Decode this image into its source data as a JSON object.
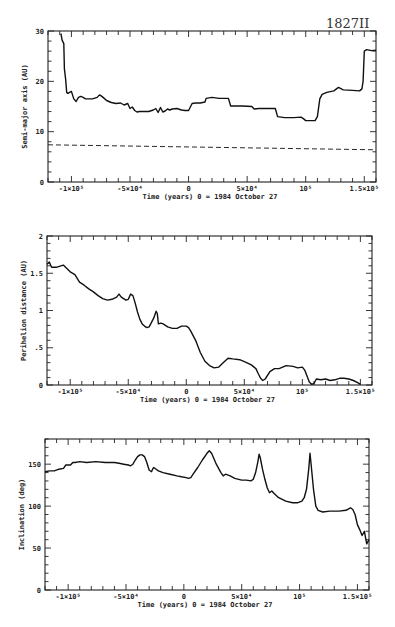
{
  "figure_label": "1827II",
  "chart_data": [
    {
      "type": "line",
      "title": "",
      "xlabel": "Time (years)  0 = 1984 October 27",
      "ylabel": "Semi-major axis (AU)",
      "xlim": [
        -120000,
        160000
      ],
      "ylim": [
        0,
        30
      ],
      "grid": false,
      "yticks": [
        0,
        10,
        20,
        30
      ],
      "ytick_labels": [
        "0",
        "10",
        "20",
        "30"
      ],
      "xticks": [
        -100000,
        -50000,
        0,
        50000,
        100000,
        150000
      ],
      "xtick_labels": [
        "-1×10⁵",
        "-5×10⁴",
        "0",
        "5×10⁴",
        "10⁵",
        "1.5×10⁵"
      ],
      "series": [
        {
          "name": "semi-major axis",
          "style": "solid",
          "x": [
            -109000,
            -108000,
            -106500,
            -106000,
            -105000,
            -104000,
            -103000,
            -100000,
            -98000,
            -96000,
            -94000,
            -92000,
            -90000,
            -88000,
            -86000,
            -82000,
            -78000,
            -76000,
            -74000,
            -72000,
            -70000,
            -68000,
            -66000,
            -62000,
            -58000,
            -55000,
            -52000,
            -50000,
            -48000,
            -46000,
            -44000,
            -42000,
            -38000,
            -34000,
            -30000,
            -28000,
            -26000,
            -24000,
            -22000,
            -20000,
            -18000,
            -16000,
            -14000,
            -10000,
            -6000,
            -3000,
            0,
            3000,
            6000,
            10000,
            14000,
            15000,
            20000,
            26000,
            34000,
            36000,
            40000,
            46000,
            54000,
            56000,
            60000,
            66000,
            74000,
            76000,
            82000,
            90000,
            96000,
            98000,
            100000,
            104000,
            108000,
            110000,
            112000,
            114000,
            118000,
            124000,
            128000,
            132000,
            140000,
            146000,
            148000,
            149000,
            150000,
            152000,
            156000,
            160000
          ],
          "y": [
            29.5,
            28.2,
            27.5,
            22.5,
            20.5,
            17.8,
            17.6,
            18.0,
            16.5,
            16.0,
            16.8,
            17.0,
            16.8,
            16.5,
            16.5,
            16.5,
            16.8,
            17.3,
            17.0,
            16.6,
            16.2,
            16.0,
            15.8,
            15.6,
            15.7,
            15.3,
            15.6,
            14.6,
            14.9,
            14.2,
            13.9,
            14.0,
            14.0,
            14.0,
            14.3,
            14.6,
            13.8,
            14.8,
            13.9,
            14.1,
            14.5,
            14.3,
            14.5,
            14.6,
            14.3,
            14.2,
            14.2,
            15.6,
            15.7,
            15.7,
            15.9,
            16.6,
            16.8,
            16.6,
            16.6,
            15.1,
            15.1,
            15.1,
            15.0,
            14.5,
            14.6,
            14.6,
            14.6,
            13.0,
            12.8,
            12.8,
            12.9,
            12.6,
            12.2,
            12.2,
            12.2,
            13.0,
            16.5,
            17.4,
            17.8,
            18.1,
            18.8,
            18.3,
            18.2,
            18.1,
            18.5,
            20.0,
            26.0,
            26.3,
            26.1,
            26.2
          ]
        },
        {
          "name": "reference (dashed)",
          "style": "dashed",
          "x": [
            -120000,
            160000
          ],
          "y": [
            7.4,
            6.4
          ]
        }
      ]
    },
    {
      "type": "line",
      "title": "",
      "xlabel": "Time (years)  0 = 1984 October 27",
      "ylabel": "Perihelion distance (AU)",
      "xlim": [
        -120000,
        160000
      ],
      "ylim": [
        0,
        2
      ],
      "grid": false,
      "yticks": [
        0,
        0.5,
        1,
        1.5,
        2
      ],
      "ytick_labels": [
        "0",
        ".5",
        "1",
        "1.5",
        "2"
      ],
      "xticks": [
        -100000,
        -50000,
        0,
        50000,
        100000,
        150000
      ],
      "xtick_labels": [
        "-1×10⁵",
        "-5×10⁴",
        "0",
        "5×10⁴",
        "10⁵",
        "1.5×10⁵"
      ],
      "series": [
        {
          "name": "perihelion distance",
          "style": "solid",
          "x": [
            -120000,
            -118000,
            -116000,
            -112000,
            -108000,
            -106000,
            -104000,
            -100000,
            -96000,
            -92000,
            -88000,
            -84000,
            -80000,
            -76000,
            -72000,
            -68000,
            -64000,
            -60000,
            -58000,
            -56000,
            -52000,
            -50000,
            -48000,
            -46000,
            -44000,
            -42000,
            -40000,
            -38000,
            -36000,
            -34000,
            -32000,
            -30000,
            -28000,
            -26000,
            -25000,
            -24000,
            -22000,
            -20000,
            -16000,
            -12000,
            -8000,
            -4000,
            0,
            2000,
            4000,
            8000,
            12000,
            16000,
            20000,
            24000,
            28000,
            32000,
            36000,
            40000,
            46000,
            52000,
            56000,
            60000,
            62000,
            64000,
            66000,
            68000,
            72000,
            76000,
            80000,
            86000,
            92000,
            96000,
            100000,
            102000,
            104000,
            106000,
            108000,
            110000,
            112000,
            116000,
            120000,
            124000,
            128000,
            132000,
            136000,
            140000,
            144000,
            148000,
            150000
          ],
          "y": [
            1.62,
            1.65,
            1.58,
            1.58,
            1.6,
            1.61,
            1.58,
            1.52,
            1.48,
            1.38,
            1.34,
            1.29,
            1.25,
            1.2,
            1.16,
            1.14,
            1.15,
            1.18,
            1.22,
            1.18,
            1.14,
            1.15,
            1.22,
            1.2,
            1.1,
            0.98,
            0.88,
            0.82,
            0.79,
            0.77,
            0.78,
            0.84,
            0.9,
            0.99,
            0.96,
            0.82,
            0.83,
            0.82,
            0.78,
            0.76,
            0.76,
            0.79,
            0.79,
            0.77,
            0.72,
            0.6,
            0.44,
            0.32,
            0.26,
            0.23,
            0.24,
            0.3,
            0.36,
            0.35,
            0.34,
            0.3,
            0.27,
            0.22,
            0.15,
            0.09,
            0.06,
            0.08,
            0.18,
            0.22,
            0.22,
            0.26,
            0.25,
            0.23,
            0.24,
            0.2,
            0.12,
            0.04,
            0.01,
            0.02,
            0.08,
            0.07,
            0.08,
            0.06,
            0.07,
            0.09,
            0.09,
            0.08,
            0.06,
            0.03,
            0.01
          ]
        }
      ]
    },
    {
      "type": "line",
      "title": "",
      "xlabel": "Time (years)  0 = 1984 October 27",
      "ylabel": "Inclination (deg)",
      "xlim": [
        -120000,
        160000
      ],
      "ylim": [
        0,
        180
      ],
      "grid": false,
      "yticks": [
        0,
        50,
        100,
        150
      ],
      "ytick_labels": [
        "0",
        "50",
        "100",
        "150"
      ],
      "xticks": [
        -100000,
        -50000,
        0,
        50000,
        100000,
        150000
      ],
      "xtick_labels": [
        "-1×10⁵",
        "-5×10⁴",
        "0",
        "5×10⁴",
        "10⁵",
        "1.5×10⁵"
      ],
      "series": [
        {
          "name": "inclination",
          "style": "solid",
          "x": [
            -120000,
            -116000,
            -112000,
            -108000,
            -104000,
            -102000,
            -98000,
            -96000,
            -94000,
            -90000,
            -84000,
            -76000,
            -68000,
            -60000,
            -56000,
            -52000,
            -48000,
            -46000,
            -44000,
            -42000,
            -40000,
            -38000,
            -36000,
            -34000,
            -32000,
            -30000,
            -28000,
            -27000,
            -26000,
            -24000,
            -22000,
            -18000,
            -12000,
            -6000,
            -2000,
            2000,
            4000,
            6000,
            8000,
            12000,
            16000,
            20000,
            22000,
            24000,
            28000,
            32000,
            34000,
            36000,
            40000,
            44000,
            50000,
            54000,
            58000,
            60000,
            62000,
            64000,
            65000,
            66000,
            68000,
            70000,
            72000,
            74000,
            76000,
            78000,
            82000,
            88000,
            94000,
            98000,
            102000,
            104000,
            106000,
            108000,
            109000,
            110000,
            112000,
            114000,
            116000,
            120000,
            126000,
            134000,
            140000,
            144000,
            146000,
            148000,
            150000,
            152000,
            154000,
            156000,
            158000,
            160000
          ],
          "y": [
            141,
            142,
            142,
            144,
            145,
            149,
            149,
            152,
            152,
            153,
            152,
            153,
            152,
            152,
            151,
            150,
            149,
            148,
            150,
            155,
            159,
            161,
            161,
            159,
            152,
            143,
            141,
            144,
            146,
            144,
            142,
            140,
            138,
            136,
            135,
            134,
            133,
            134,
            138,
            146,
            155,
            163,
            166,
            163,
            150,
            140,
            136,
            138,
            136,
            133,
            131,
            131,
            130,
            132,
            140,
            153,
            162,
            158,
            144,
            132,
            122,
            116,
            118,
            115,
            110,
            106,
            104,
            104,
            106,
            110,
            120,
            145,
            163,
            150,
            120,
            100,
            95,
            93,
            94,
            94,
            95,
            98,
            96,
            90,
            78,
            72,
            65,
            70,
            55,
            60
          ]
        }
      ]
    }
  ]
}
